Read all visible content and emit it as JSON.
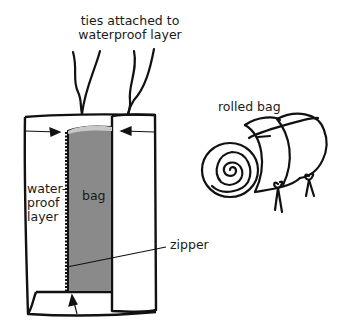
{
  "labels": {
    "ties": [
      "ties attached to",
      "waterproof layer"
    ],
    "rolled": "rolled bag",
    "waterproof": [
      "water-",
      "proof",
      "layer"
    ],
    "bag": "bag",
    "zipper": "zipper"
  },
  "colors": {
    "ink": "#111111",
    "bag_fill": "#8a8a8a",
    "bag_top": "#c8c8c8",
    "background": "#ffffff"
  }
}
